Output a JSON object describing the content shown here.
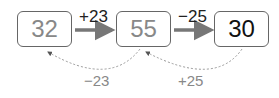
{
  "boxes": [
    {
      "value": "32",
      "style": "muted"
    },
    {
      "value": "55",
      "style": "muted"
    },
    {
      "value": "30",
      "style": "final"
    }
  ],
  "forward_ops": [
    {
      "label": "+23",
      "from": 0,
      "to": 1
    },
    {
      "label": "−25",
      "from": 1,
      "to": 2
    }
  ],
  "backward_ops": [
    {
      "label": "−23",
      "from": 1,
      "to": 0
    },
    {
      "label": "+25",
      "from": 2,
      "to": 1
    }
  ],
  "colors": {
    "box_border": "#666666",
    "muted_text": "#888888",
    "final_text": "#111111",
    "arrow": "#777777",
    "dotted": "#999999"
  }
}
